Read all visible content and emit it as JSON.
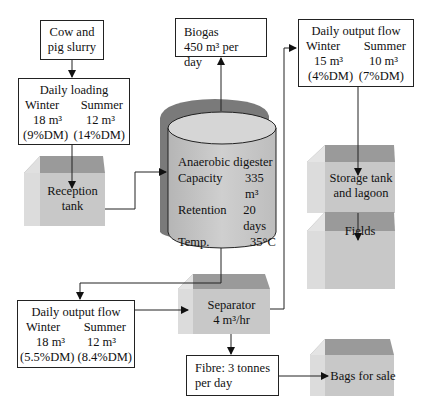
{
  "diagram": {
    "nodes": {
      "slurry": {
        "line1": "Cow and",
        "line2": "pig slurry"
      },
      "daily_loading": {
        "title": "Daily loading",
        "winter_label": "Winter",
        "summer_label": "Summer",
        "winter_volume": "18 m³",
        "summer_volume": "12 m³",
        "winter_dm": "(9%DM)",
        "summer_dm": "(14%DM)"
      },
      "reception_tank": {
        "line1": "Reception",
        "line2": "tank"
      },
      "biogas": {
        "line1": "Biogas",
        "line2": "450 m³ per day"
      },
      "digester": {
        "title": "Anaerobic digester",
        "capacity_label": "Capacity",
        "capacity_value": "335 m³",
        "retention_label": "Retention",
        "retention_value": "20 days",
        "temp_label": "Temp.",
        "temp_value": "35°C"
      },
      "output_top": {
        "title": "Daily output flow",
        "winter_label": "Winter",
        "summer_label": "Summer",
        "winter_volume": "15 m³",
        "summer_volume": "10 m³",
        "winter_dm": "(4%DM)",
        "summer_dm": "(7%DM)"
      },
      "storage": {
        "line1": "Storage tank",
        "line2": "and lagoon"
      },
      "fields": {
        "line1": "Fields"
      },
      "output_bottom": {
        "title": "Daily output flow",
        "winter_label": "Winter",
        "summer_label": "Summer",
        "winter_volume": "18 m³",
        "summer_volume": "12 m³",
        "winter_dm": "(5.5%DM)",
        "summer_dm": "(8.4%DM)"
      },
      "separator": {
        "line1": "Separator",
        "line2": "4 m³/hr"
      },
      "fibre": {
        "line1": "Fibre: 3 tonnes",
        "line2": "per day"
      },
      "bags": {
        "line1": "Bags for sale"
      }
    },
    "colors": {
      "block_front": "#c8c8c8",
      "block_top": "#9a9a9a",
      "block_side": "#dedede",
      "cylinder_body": "#c4c4c4",
      "cylinder_shadow": "#7a7a7a",
      "line": "#222222"
    }
  }
}
